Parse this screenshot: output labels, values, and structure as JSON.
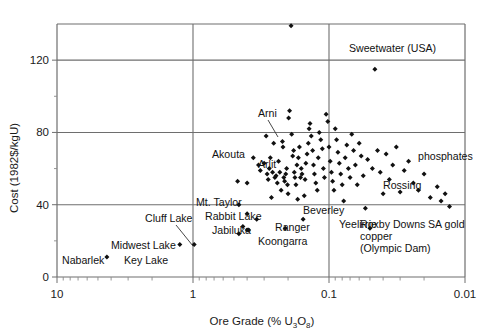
{
  "chart_data": {
    "type": "scatter",
    "title": "",
    "xlabel": "Ore Grade (% U3O8)",
    "xlabel_parts": {
      "pre": "Ore Grade (% U",
      "sub1": "3",
      "mid": "O",
      "sub2": "8",
      "post": ")"
    },
    "ylabel": "Cost (1982$/kgU)",
    "x_scale": "log-reversed",
    "xlim": [
      10,
      0.01
    ],
    "ylim": [
      0,
      140
    ],
    "xticks": [
      "10",
      "1",
      "0.1",
      "0.01"
    ],
    "xtick_values": [
      10,
      1,
      0.1,
      0.01
    ],
    "yticks": [
      "0",
      "40",
      "80",
      "120"
    ],
    "ytick_values": [
      0,
      40,
      80,
      120
    ],
    "y_minor_step": 20,
    "grid": "major gridlines at y=40, y=80, y=120 and x=1, x=0.1",
    "legend": "none",
    "annotations": [
      {
        "label": "Sweetwater (USA)",
        "x": 0.19,
        "y": 130,
        "point": [
          0.19,
          139
        ]
      },
      {
        "label": "Arni",
        "x": 0.45,
        "y": 88,
        "point": [
          0.4,
          72
        ],
        "leader": true
      },
      {
        "label": "phosphates",
        "x": 0.022,
        "y": 56,
        "point": [
          0.026,
          64
        ]
      },
      {
        "label": "Rossing",
        "x": 0.055,
        "y": 45,
        "point": [
          0.062,
          51
        ]
      },
      {
        "label": "Akouta",
        "x": 0.62,
        "y": 53,
        "point": [
          0.47,
          53
        ]
      },
      {
        "label": "Arlit",
        "x": 0.4,
        "y": 47,
        "point": [
          0.4,
          52
        ]
      },
      {
        "label": "Mt. Taylor",
        "x": 0.7,
        "y": 40,
        "point": [
          0.46,
          40
        ]
      },
      {
        "label": "Rabbit Lake",
        "x": 0.72,
        "y": 35,
        "point": [
          0.4,
          35
        ]
      },
      {
        "label": "Beverley",
        "x": 0.29,
        "y": 32,
        "point": [
          0.34,
          32
        ]
      },
      {
        "label": "Yeelirrie",
        "x": 0.17,
        "y": 27,
        "point": [
          0.21,
          27
        ]
      },
      {
        "label": "Jabiluka",
        "x": 0.66,
        "y": 28,
        "point": [
          0.43,
          28
        ]
      },
      {
        "label": "Ranger",
        "x": 0.3,
        "y": 25,
        "point": [
          0.39,
          26
        ]
      },
      {
        "label": "Koongarra",
        "x": 0.38,
        "y": 21,
        "point": [
          0.46,
          24
        ]
      },
      {
        "label": "Cluff Lake",
        "x": 1.9,
        "y": 31,
        "point": [
          0.98,
          18
        ],
        "leader": true
      },
      {
        "label": "Midwest Lake",
        "x": 2.9,
        "y": 19,
        "point": [
          1.25,
          18
        ]
      },
      {
        "label": "Key Lake",
        "x": 2.4,
        "y": 11,
        "point": [
          4.3,
          11
        ]
      },
      {
        "label": "Nabarlek",
        "x": 5.6,
        "y": 12,
        "point": [
          4.3,
          11
        ]
      },
      {
        "label": "Roxby Downs copper (Olympic Dam)",
        "x": 0.14,
        "y": 26,
        "point": [
          0.155,
          32
        ]
      },
      {
        "label": "SA gold",
        "x": 0.045,
        "y": 27,
        "point": [
          0.05,
          27
        ]
      }
    ],
    "annotation_labels": [
      "Sweetwater (USA)",
      "Arni",
      "phosphates",
      "Rossing",
      "Akouta",
      "Arlit",
      "Mt. Taylor",
      "Rabbit Lake",
      "Beverley",
      "Yeelirrie",
      "Jabiluka",
      "Ranger",
      "Koongarra",
      "Cluff Lake",
      "Midwest Lake",
      "Key Lake",
      "Nabarlek",
      "Roxby Downs",
      "copper",
      "(Olympic Dam)",
      "SA gold"
    ],
    "points": [
      [
        4.3,
        11
      ],
      [
        1.25,
        18
      ],
      [
        0.98,
        18
      ],
      [
        0.47,
        53
      ],
      [
        0.46,
        40
      ],
      [
        0.46,
        24
      ],
      [
        0.43,
        28
      ],
      [
        0.4,
        35
      ],
      [
        0.4,
        52
      ],
      [
        0.4,
        26
      ],
      [
        0.39,
        26
      ],
      [
        0.36,
        66
      ],
      [
        0.34,
        32
      ],
      [
        0.33,
        62
      ],
      [
        0.32,
        59
      ],
      [
        0.3,
        63
      ],
      [
        0.29,
        78
      ],
      [
        0.285,
        57
      ],
      [
        0.28,
        54
      ],
      [
        0.275,
        60
      ],
      [
        0.27,
        66
      ],
      [
        0.265,
        44
      ],
      [
        0.26,
        58
      ],
      [
        0.255,
        74
      ],
      [
        0.25,
        55
      ],
      [
        0.245,
        56
      ],
      [
        0.24,
        52
      ],
      [
        0.235,
        64
      ],
      [
        0.23,
        58
      ],
      [
        0.225,
        48
      ],
      [
        0.22,
        75
      ],
      [
        0.218,
        72
      ],
      [
        0.215,
        55
      ],
      [
        0.212,
        53
      ],
      [
        0.21,
        27
      ],
      [
        0.208,
        57
      ],
      [
        0.205,
        60
      ],
      [
        0.202,
        51
      ],
      [
        0.2,
        46
      ],
      [
        0.198,
        88
      ],
      [
        0.195,
        92
      ],
      [
        0.19,
        139
      ],
      [
        0.188,
        79
      ],
      [
        0.185,
        67
      ],
      [
        0.182,
        70
      ],
      [
        0.18,
        58
      ],
      [
        0.178,
        55
      ],
      [
        0.175,
        51
      ],
      [
        0.172,
        62
      ],
      [
        0.17,
        43
      ],
      [
        0.168,
        66
      ],
      [
        0.165,
        72
      ],
      [
        0.162,
        55
      ],
      [
        0.16,
        60
      ],
      [
        0.158,
        57
      ],
      [
        0.155,
        32
      ],
      [
        0.152,
        45
      ],
      [
        0.15,
        54
      ],
      [
        0.148,
        63
      ],
      [
        0.145,
        68
      ],
      [
        0.142,
        74
      ],
      [
        0.14,
        82
      ],
      [
        0.138,
        85
      ],
      [
        0.135,
        78
      ],
      [
        0.132,
        70
      ],
      [
        0.13,
        62
      ],
      [
        0.128,
        57
      ],
      [
        0.125,
        52
      ],
      [
        0.122,
        48
      ],
      [
        0.12,
        66
      ],
      [
        0.118,
        80
      ],
      [
        0.115,
        76
      ],
      [
        0.112,
        71
      ],
      [
        0.11,
        60
      ],
      [
        0.108,
        55
      ],
      [
        0.105,
        90
      ],
      [
        0.102,
        86
      ],
      [
        0.1,
        72
      ],
      [
        0.098,
        64
      ],
      [
        0.096,
        58
      ],
      [
        0.094,
        53
      ],
      [
        0.092,
        48
      ],
      [
        0.09,
        82
      ],
      [
        0.088,
        76
      ],
      [
        0.086,
        69
      ],
      [
        0.084,
        63
      ],
      [
        0.082,
        57
      ],
      [
        0.08,
        51
      ],
      [
        0.078,
        42
      ],
      [
        0.076,
        66
      ],
      [
        0.074,
        73
      ],
      [
        0.072,
        60
      ],
      [
        0.07,
        55
      ],
      [
        0.068,
        79
      ],
      [
        0.066,
        70
      ],
      [
        0.064,
        62
      ],
      [
        0.062,
        51
      ],
      [
        0.06,
        74
      ],
      [
        0.058,
        67
      ],
      [
        0.056,
        56
      ],
      [
        0.054,
        38
      ],
      [
        0.052,
        65
      ],
      [
        0.05,
        27
      ],
      [
        0.048,
        60
      ],
      [
        0.046,
        115
      ],
      [
        0.044,
        70
      ],
      [
        0.042,
        58
      ],
      [
        0.04,
        46
      ],
      [
        0.038,
        68
      ],
      [
        0.036,
        54
      ],
      [
        0.034,
        62
      ],
      [
        0.032,
        72
      ],
      [
        0.03,
        47
      ],
      [
        0.028,
        59
      ],
      [
        0.026,
        64
      ],
      [
        0.024,
        52
      ],
      [
        0.022,
        48
      ],
      [
        0.02,
        57
      ],
      [
        0.018,
        44
      ],
      [
        0.016,
        50
      ],
      [
        0.015,
        42
      ],
      [
        0.014,
        46
      ],
      [
        0.013,
        39
      ]
    ]
  },
  "colors": {
    "axis": "#6e6e6e",
    "point": "#111111",
    "text": "#111111",
    "background": "#ffffff"
  }
}
